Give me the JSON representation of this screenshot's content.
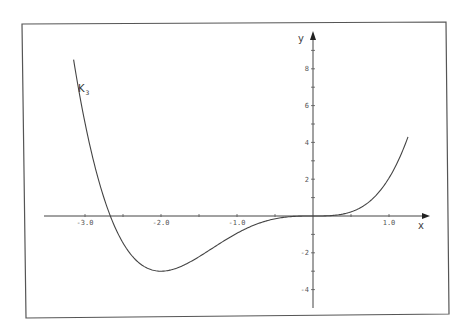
{
  "chart_data": {
    "type": "line",
    "title": "",
    "xlabel": "x",
    "ylabel": "y",
    "xlim": [
      -3.5,
      1.5
    ],
    "ylim": [
      -5,
      9.5
    ],
    "grid": false,
    "x_ticks": [
      -3.0,
      -2.5,
      -2.0,
      -1.5,
      -1.0,
      -0.5,
      0.5,
      1.0
    ],
    "x_tick_labels": [
      "-3.0",
      "-2.0",
      "-1.0",
      "1.0"
    ],
    "x_tick_label_values": [
      -3.0,
      -2.0,
      -1.0,
      1.0
    ],
    "y_ticks": [
      -4,
      -3,
      -2,
      -1,
      1,
      2,
      3,
      4,
      5,
      6,
      7,
      8,
      9
    ],
    "y_tick_labels": [
      "8",
      "6",
      "4",
      "2",
      "-2",
      "-4"
    ],
    "y_tick_label_values": [
      8,
      6,
      4,
      2,
      -2,
      -4
    ],
    "series": [
      {
        "name": "K3",
        "label_main": "K",
        "label_sub": "3",
        "description": "quartic curve with triple root at 0, root near -2.67, minimum about (-2, -3)",
        "x": [
          -3.15,
          -3.0,
          -2.8,
          -2.67,
          -2.5,
          -2.25,
          -2.0,
          -1.75,
          -1.5,
          -1.25,
          -1.0,
          -0.75,
          -0.5,
          -0.25,
          0.0,
          0.25,
          0.5,
          0.75,
          1.0,
          1.25
        ],
        "y": [
          8.5,
          5.1,
          1.7,
          0.0,
          -1.95,
          -2.93,
          -3.0,
          -2.62,
          -1.9,
          -1.24,
          -0.94,
          -0.43,
          -0.12,
          -0.02,
          0.0,
          0.03,
          0.24,
          0.88,
          2.06,
          4.3
        ]
      }
    ]
  }
}
